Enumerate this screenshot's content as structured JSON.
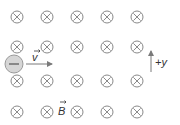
{
  "diagram": {
    "field_symbol": "into-page-cross",
    "colors": {
      "symbol": "#8a8a8a",
      "electron_fill": "#d6d6d6",
      "electron_stroke": "#9a9a9a",
      "arrow": "#7a7a7a",
      "text": "#333333"
    },
    "grid": {
      "columns_x": [
        17,
        47,
        77,
        107,
        137
      ],
      "rows_y": [
        17,
        47,
        77,
        107
      ]
    },
    "electron": {
      "charge_symbol": "−",
      "x": 14,
      "y": 64,
      "r": 9
    },
    "velocity": {
      "label": "v",
      "x1": 26,
      "x2": 53,
      "y": 64
    },
    "axis": {
      "label": "+y",
      "x": 151,
      "y1": 72,
      "y2": 50
    },
    "field": {
      "label": "B"
    }
  }
}
